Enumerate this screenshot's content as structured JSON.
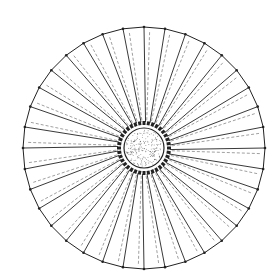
{
  "diagram": {
    "type": "radial-structure",
    "center": [
      144,
      148
    ],
    "outer_radius": 121,
    "inner_radius": 20,
    "spoke_count": 36,
    "colors": {
      "line": "#222222",
      "dashed": "#777777",
      "stipple": "#555555",
      "background": "#ffffff"
    }
  }
}
